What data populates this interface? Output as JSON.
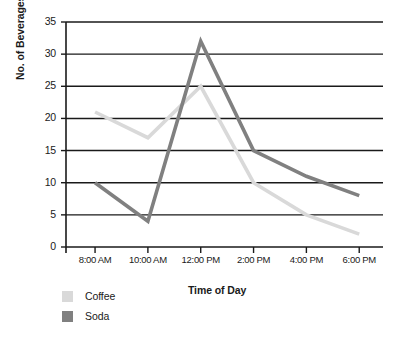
{
  "chart_data": {
    "type": "line",
    "title": "",
    "xlabel": "Time of Day",
    "ylabel": "No. of Beverages Sold",
    "categories": [
      "8:00 AM",
      "10:00 AM",
      "12:00 PM",
      "2:00 PM",
      "4:00 PM",
      "6:00 PM"
    ],
    "series": [
      {
        "name": "Coffee",
        "color": "#d9d9d9",
        "values": [
          21,
          17,
          25,
          10,
          5,
          2
        ]
      },
      {
        "name": "Soda",
        "color": "#808080",
        "values": [
          10,
          4,
          32,
          15,
          11,
          8
        ]
      }
    ],
    "ylim": [
      0,
      35
    ],
    "yticks": [
      0,
      5,
      10,
      15,
      20,
      25,
      30,
      35
    ],
    "ytick_labels": [
      "0",
      "5",
      "10",
      "15",
      "20",
      "25",
      "30",
      "35"
    ],
    "grid": true,
    "grid_color": "#1a1a1a",
    "legend_position": "bottom-left"
  },
  "legend": {
    "items": [
      {
        "label": "Coffee"
      },
      {
        "label": "Soda"
      }
    ]
  }
}
